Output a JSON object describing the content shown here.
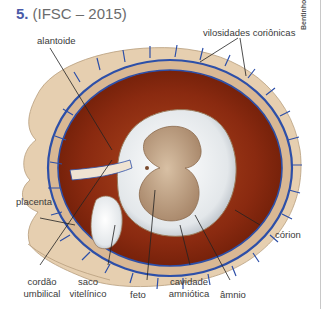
{
  "question": {
    "number": "5.",
    "source": "(IFSC – 2015)"
  },
  "credit": "Bentinho",
  "labels": {
    "alantoide": "alantoide",
    "vilosidades": "vilosidades coriônicas",
    "placenta": "placenta",
    "corion": "córion",
    "cordao_1": "cordão",
    "cordao_2": "umbilical",
    "saco_1": "saco",
    "saco_2": "vitelínico",
    "feto": "feto",
    "cavidade_1": "cavidade",
    "cavidade_2": "amniótica",
    "amnio": "âmnio"
  },
  "colors": {
    "number_accent": "#4a5aa8",
    "decidua": "#e6cfb0",
    "chorion_vessel": "#2d4fa8",
    "blood_space": "#8a2a10",
    "amnion": "#e8ebee",
    "embryo": "#b99a7c"
  }
}
